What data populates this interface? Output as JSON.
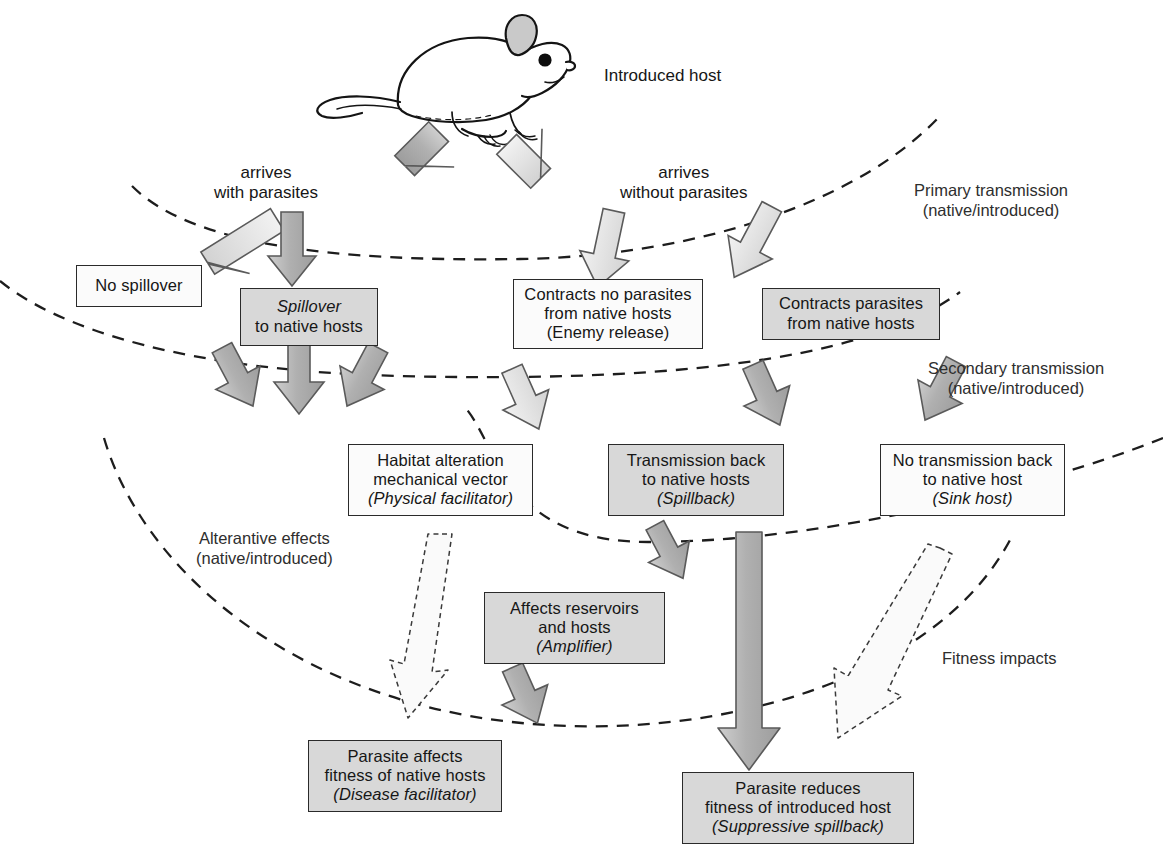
{
  "figure": {
    "title_text": "Introduced host",
    "mouse_icon": "mouse-illustration"
  },
  "flow_labels": [
    {
      "id": "arrives-with-parasites",
      "line1": "arrives",
      "line2": "with parasites"
    },
    {
      "id": "arrives-without-parasites",
      "line1": "arrives",
      "line2": "without parasites"
    }
  ],
  "zone_labels": [
    {
      "id": "primary-transmission",
      "line1": "Primary transmission",
      "line2": "(native/introduced)"
    },
    {
      "id": "secondary-transmission",
      "line1": "Secondary transmission",
      "line2": "(native/introduced)"
    },
    {
      "id": "alternative-effects",
      "line1": "Alterantive effects",
      "line2": "(native/introduced)"
    },
    {
      "id": "fitness-impacts",
      "line1": "Fitness impacts",
      "line2": ""
    }
  ],
  "nodes": [
    {
      "id": "no-spillover",
      "fill": "white",
      "lines": [
        {
          "text": "No spillover",
          "italic": false
        }
      ]
    },
    {
      "id": "spillover-to-native-hosts",
      "fill": "grey",
      "lines": [
        {
          "text": "Spillover",
          "italic": true
        },
        {
          "text": "to native hosts",
          "italic": false
        }
      ]
    },
    {
      "id": "contracts-no-parasites",
      "fill": "white",
      "lines": [
        {
          "text": "Contracts no parasites",
          "italic": false
        },
        {
          "text": "from native hosts",
          "italic": false
        },
        {
          "text": "(Enemy release)",
          "italic": false
        }
      ]
    },
    {
      "id": "contracts-parasites",
      "fill": "grey",
      "lines": [
        {
          "text": "Contracts parasites",
          "italic": false
        },
        {
          "text": "from native hosts",
          "italic": false
        }
      ]
    },
    {
      "id": "habitat-alteration",
      "fill": "white",
      "lines": [
        {
          "text": "Habitat alteration",
          "italic": false
        },
        {
          "text": "mechanical vector",
          "italic": false
        },
        {
          "text": "(Physical facilitator)",
          "italic": true
        }
      ]
    },
    {
      "id": "transmission-back-to-native-hosts",
      "fill": "grey",
      "lines": [
        {
          "text": "Transmission back",
          "italic": false
        },
        {
          "text": "to native hosts",
          "italic": false
        },
        {
          "text": "(Spillback)",
          "italic": true
        }
      ]
    },
    {
      "id": "no-transmission-back",
      "fill": "white",
      "lines": [
        {
          "text": "No transmission back",
          "italic": false
        },
        {
          "text": "to native host",
          "italic": false
        },
        {
          "text": "(Sink host)",
          "italic": true
        }
      ]
    },
    {
      "id": "affects-reservoirs-and-hosts",
      "fill": "grey",
      "lines": [
        {
          "text": "Affects reservoirs",
          "italic": false
        },
        {
          "text": "and hosts",
          "italic": false
        },
        {
          "text": "(Amplifier)",
          "italic": true
        }
      ]
    },
    {
      "id": "parasite-affects-fitness-native",
      "fill": "grey",
      "lines": [
        {
          "text": "Parasite affects",
          "italic": false
        },
        {
          "text": "fitness of native hosts",
          "italic": false
        },
        {
          "text": "(Disease facilitator)",
          "italic": true
        }
      ]
    },
    {
      "id": "parasite-reduces-fitness-introduced",
      "fill": "grey",
      "lines": [
        {
          "text": "Parasite reduces",
          "italic": false
        },
        {
          "text": "fitness of introduced host",
          "italic": false
        },
        {
          "text": "(Suppressive spillback)",
          "italic": true
        }
      ]
    }
  ],
  "colors": {
    "arrow_dark_fill": "#b3b3b3",
    "arrow_light_fill": "#e3e3e3",
    "arrow_outline": "#5a5a5a",
    "box_grey": "#d8d8d8",
    "box_white": "#fbfbfb",
    "box_border": "#2a2a2a",
    "dashed_curve": "#1d1d1d",
    "text": "#161616"
  },
  "arrows": [
    {
      "id": "arrow-host-to-with-parasites",
      "style": "dark",
      "from": "introduced-host",
      "to": "arrives-with-parasites"
    },
    {
      "id": "arrow-host-to-without-parasites",
      "style": "light",
      "from": "introduced-host",
      "to": "arrives-without-parasites"
    },
    {
      "id": "arrow-to-no-spillover",
      "style": "light",
      "from": "arrives-with-parasites",
      "to": "no-spillover"
    },
    {
      "id": "arrow-to-spillover",
      "style": "dark",
      "from": "arrives-with-parasites",
      "to": "spillover-to-native-hosts"
    },
    {
      "id": "arrow-to-contracts-no-parasites",
      "style": "light",
      "from": "arrives-without-parasites",
      "to": "contracts-no-parasites"
    },
    {
      "id": "arrow-to-contracts-parasites",
      "style": "light",
      "from": "arrives-without-parasites",
      "to": "contracts-parasites"
    },
    {
      "id": "arrow-spillover-left",
      "style": "dark",
      "from": "spillover-to-native-hosts",
      "to": "alternative-effects-zone"
    },
    {
      "id": "arrow-spillover-center",
      "style": "dark",
      "from": "spillover-to-native-hosts",
      "to": "alternative-effects-zone"
    },
    {
      "id": "arrow-spillover-right",
      "style": "dark",
      "from": "spillover-to-native-hosts",
      "to": "alternative-effects-zone"
    },
    {
      "id": "arrow-to-habitat-alteration",
      "style": "light",
      "from": "contracts-no-parasites",
      "to": "habitat-alteration"
    },
    {
      "id": "arrow-to-transmission-back",
      "style": "dark",
      "from": "contracts-parasites",
      "to": "transmission-back-to-native-hosts"
    },
    {
      "id": "arrow-to-no-transmission-back",
      "style": "dark",
      "from": "contracts-parasites",
      "to": "no-transmission-back"
    },
    {
      "id": "arrow-to-affects-reservoirs",
      "style": "dark",
      "from": "transmission-back-to-native-hosts",
      "to": "affects-reservoirs-and-hosts"
    },
    {
      "id": "arrow-to-parasite-affects-fitness",
      "style": "outline",
      "from": "habitat-alteration",
      "to": "parasite-affects-fitness-native"
    },
    {
      "id": "arrow-amplifier-to-parasite-affects",
      "style": "dark",
      "from": "affects-reservoirs-and-hosts",
      "to": "parasite-affects-fitness-native"
    },
    {
      "id": "arrow-spillback-to-reduced-fitness",
      "style": "dark-long",
      "from": "transmission-back-to-native-hosts",
      "to": "parasite-reduces-fitness-introduced"
    },
    {
      "id": "arrow-sink-host-fitness",
      "style": "outline",
      "from": "no-transmission-back",
      "to": "fitness-impacts-zone"
    }
  ]
}
